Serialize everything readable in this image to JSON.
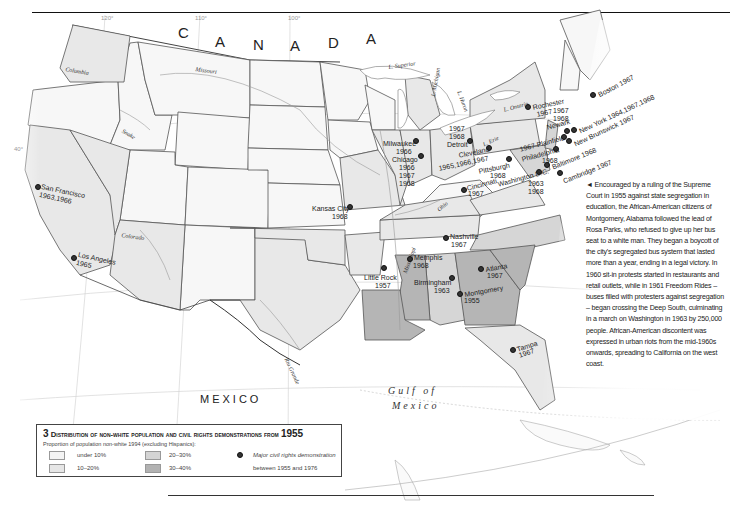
{
  "map": {
    "country_labels": {
      "canada": [
        "C",
        "A",
        "N",
        "A",
        "D",
        "A"
      ],
      "mexico": "MEXICO"
    },
    "water_labels": {
      "gulf_line1": "Gulf of",
      "gulf_line2": "Mexico",
      "lake_superior": "L. Superior",
      "lake_michigan": "L. Michigan",
      "lake_huron": "L. Huron",
      "lake_erie": "L. Erie",
      "lake_ontario": "L. Ontario"
    },
    "river_labels": {
      "columbia": "Columbia",
      "missouri": "Missouri",
      "snake": "Snake",
      "colorado": "Colorado",
      "rio_grande": "Rio Grande",
      "mississippi": "Mississippi",
      "ohio": "Ohio"
    },
    "graticule_labels": {
      "lon120": "120°",
      "lon110": "110°",
      "lon100": "100°",
      "lat40": "40°"
    },
    "demonstrations": [
      {
        "city": "San Francisco",
        "years": "1963,1966"
      },
      {
        "city": "Los Angeles",
        "years": "1965"
      },
      {
        "city": "Kansas City",
        "years": "1968"
      },
      {
        "city": "Milwaukee",
        "years": "1966"
      },
      {
        "city": "Chicago",
        "years": "1966 1967 1968"
      },
      {
        "city": "Detroit",
        "years": "1967 1968"
      },
      {
        "city": "Cleveland",
        "years": "1965,1966,1967"
      },
      {
        "city": "Pittsburgh",
        "years": "1968"
      },
      {
        "city": "Cincinnati",
        "years": "1967"
      },
      {
        "city": "Rochester",
        "years": "1967"
      },
      {
        "city": "Boston",
        "years": "1967"
      },
      {
        "city": "Newark",
        "years": "1967 1968"
      },
      {
        "city": "New York",
        "years": "1964,1967,1968"
      },
      {
        "city": "Plainfield",
        "years": "1967"
      },
      {
        "city": "New Brunswick",
        "years": "1967"
      },
      {
        "city": "Philadelphia",
        "years": "1968"
      },
      {
        "city": "Baltimore",
        "years": "1968"
      },
      {
        "city": "Washington D.C.",
        "years": "1963 1968"
      },
      {
        "city": "Cambridge",
        "years": "1967"
      },
      {
        "city": "Nashville",
        "years": "1967"
      },
      {
        "city": "Memphis",
        "years": "1968"
      },
      {
        "city": "Little Rock",
        "years": "1957"
      },
      {
        "city": "Birmingham",
        "years": "1963"
      },
      {
        "city": "Atlanta",
        "years": "1967"
      },
      {
        "city": "Montgomery",
        "years": "1955"
      },
      {
        "city": "Tampa",
        "years": "1967"
      }
    ],
    "labels": {
      "sf1": "San Francisco",
      "sf2": "1963,1966",
      "la1": "Los Angeles",
      "la2": "1965",
      "kc1": "Kansas City",
      "kc2": "1968",
      "mil1": "Milwaukee",
      "mil2": "1966",
      "chi1": "Chicago",
      "chi2": "1966",
      "chi3": "1967",
      "chi4": "1968",
      "det0": "1967",
      "det1": "1968",
      "det2": "Detroit",
      "cle1": "Cleveland",
      "cle2": "1965,1966,1967",
      "pit1": "Pittsburgh",
      "pit2": "1968",
      "cin1": "Cincinnati",
      "cin2": "1967",
      "roc1": "Rochester",
      "roc2": "1967",
      "bos": "Boston 1967",
      "nwk0": "1967",
      "nwk1": "1968",
      "nwk2": "Newark",
      "ny": "New York 1964,1967,1968",
      "pla": "1967 Plainfield",
      "nb": "New Brunswick 1967",
      "phi1": "Philadelphia",
      "phi2": "1968",
      "bal": "Baltimore 1968",
      "dc1": "Washington D.C.",
      "dc2": "1963",
      "dc3": "1968",
      "cam": "Cambridge 1967",
      "nas1": "Nashville",
      "nas2": "1967",
      "mem1": "Memphis",
      "mem2": "1968",
      "lr1": "Little Rock",
      "lr2": "1957",
      "bir1": "Birmingham",
      "bir2": "1963",
      "atl1": "Atlanta",
      "atl2": "1967",
      "mon1": "Montgomery",
      "mon2": "1955",
      "tam1": "Tampa",
      "tam2": "1967"
    }
  },
  "sidebar_text": "◄ Encouraged by a ruling of the Supreme Court in 1955 against state segregation in education, the African-American citizens of Montgomery, Alabama followed the lead of Rosa Parks, who refused to give up her bus seat to a white man. They began a boycott of the city's segregated bus system that lasted more than a year, ending in a legal victory. In 1960 sit-in protests started in restaurants and retail outlets, while in 1961 Freedom Rides – buses filled with protesters against segregation – began crossing the Deep South, culminating in a march on Washington in 1963 by 250,000 people. African-American discontent was expressed in urban riots from the mid-1960s onwards, spreading to California on the west coast.",
  "legend": {
    "number": "3",
    "title": "Distribution of non-white population and civil rights demonstrations from",
    "year": "1955",
    "subtitle": "Proportion of population non-white 1994 (excluding Hispanics):",
    "items": [
      {
        "label": "under 10%",
        "color": "#f4f4f4"
      },
      {
        "label": "10–20%",
        "color": "#e6e6e6"
      },
      {
        "label": "20–30%",
        "color": "#d4d4d4"
      },
      {
        "label": "30–40%",
        "color": "#b2b2b2"
      }
    ],
    "symbol_label_1": "Major civil rights demonstration",
    "symbol_label_2": "between 1955 and 1976"
  },
  "colors": {
    "under10": "#f4f4f4",
    "p10_20": "#e6e6e6",
    "p20_30": "#d4d4d4",
    "p30_40": "#b2b2b2",
    "border": "#444444",
    "water": "#ffffff"
  }
}
